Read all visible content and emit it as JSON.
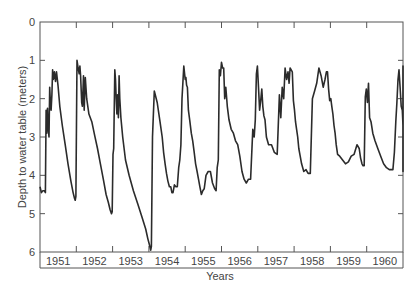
{
  "chart_data": {
    "type": "line",
    "title": "",
    "xlabel": "Years",
    "ylabel": "Depth to water table (meters)",
    "ylim": [
      0,
      6
    ],
    "y_inverted": true,
    "yticks": [
      0,
      1,
      2,
      3,
      4,
      5,
      6
    ],
    "xlim": [
      1950.0,
      1960.1
    ],
    "x_category_labels": [
      "1951",
      "1952",
      "1953",
      "1954",
      "1955",
      "1956",
      "1957",
      "1958",
      "1959",
      "1960"
    ],
    "grid": false,
    "legend": null,
    "line_color": "#2b2b2b",
    "note": "Values are approximate, estimated visually from the plotted curve (not transcribed from source data).",
    "series": [
      {
        "name": "Depth to water table",
        "x": [
          1950.0,
          1950.04,
          1950.08,
          1950.12,
          1950.15,
          1950.17,
          1950.19,
          1950.21,
          1950.23,
          1950.25,
          1950.27,
          1950.29,
          1950.31,
          1950.33,
          1950.35,
          1950.37,
          1950.4,
          1950.43,
          1950.46,
          1950.5,
          1950.55,
          1950.62,
          1950.7,
          1950.78,
          1950.86,
          1950.92,
          1950.96,
          1950.98,
          1951.0,
          1951.03,
          1951.06,
          1951.09,
          1951.11,
          1951.13,
          1951.16,
          1951.18,
          1951.21,
          1951.23,
          1951.26,
          1951.3,
          1951.36,
          1951.44,
          1951.52,
          1951.6,
          1951.68,
          1951.76,
          1951.84,
          1951.9,
          1951.95,
          1951.99,
          1952.01,
          1952.03,
          1952.05,
          1952.08,
          1952.1,
          1952.12,
          1952.14,
          1952.16,
          1952.18,
          1952.2,
          1952.22,
          1952.25,
          1952.3,
          1952.38,
          1952.48,
          1952.6,
          1952.72,
          1952.84,
          1952.94,
          1953.0,
          1953.04,
          1953.08,
          1953.1,
          1953.13,
          1953.18,
          1953.26,
          1953.34,
          1953.4,
          1953.44,
          1953.48,
          1953.52,
          1953.56,
          1953.6,
          1953.64,
          1953.67,
          1953.7,
          1953.74,
          1953.78,
          1953.82,
          1953.86,
          1953.89,
          1953.92,
          1953.95,
          1954.0,
          1954.04,
          1954.06,
          1954.08,
          1954.1,
          1954.13,
          1954.17,
          1954.21,
          1954.25,
          1954.29,
          1954.33,
          1954.37,
          1954.41,
          1954.45,
          1954.49,
          1954.53,
          1954.57,
          1954.62,
          1954.68,
          1954.74,
          1954.8,
          1954.86,
          1954.9,
          1954.93,
          1954.96,
          1954.99,
          1955.02,
          1955.05,
          1955.08,
          1955.11,
          1955.14,
          1955.17,
          1955.21,
          1955.26,
          1955.32,
          1955.38,
          1955.44,
          1955.5,
          1955.56,
          1955.62,
          1955.68,
          1955.74,
          1955.8,
          1955.86,
          1955.92,
          1955.96,
          1955.99,
          1956.02,
          1956.05,
          1956.08,
          1956.11,
          1956.14,
          1956.17,
          1956.2,
          1956.23,
          1956.26,
          1956.3,
          1956.36,
          1956.44,
          1956.52,
          1956.6,
          1956.66,
          1956.7,
          1956.74,
          1956.78,
          1956.82,
          1956.86,
          1956.9,
          1956.93,
          1956.96,
          1956.99,
          1957.02,
          1957.05,
          1957.08,
          1957.11,
          1957.14,
          1957.17,
          1957.2,
          1957.24,
          1957.28,
          1957.34,
          1957.4,
          1957.46,
          1957.52,
          1957.58,
          1957.64,
          1957.7,
          1957.76,
          1957.82,
          1957.88,
          1957.93,
          1957.97,
          1958.0,
          1958.03,
          1958.06,
          1958.09,
          1958.12,
          1958.15,
          1958.18,
          1958.21,
          1958.24,
          1958.28,
          1958.34,
          1958.42,
          1958.5,
          1958.58,
          1958.66,
          1958.74,
          1958.82,
          1958.88,
          1958.92,
          1958.96,
          1958.99,
          1959.02,
          1959.05,
          1959.08,
          1959.11,
          1959.14,
          1959.17,
          1959.21,
          1959.26,
          1959.32,
          1959.4,
          1959.48,
          1959.56,
          1959.64,
          1959.72,
          1959.78,
          1959.82,
          1959.86,
          1959.9,
          1959.93,
          1959.96,
          1959.99,
          1960.02,
          1960.05,
          1960.08,
          1960.11,
          1960.14,
          1960.17,
          1960.2,
          1960.24,
          1960.28,
          1960.32,
          1960.36,
          1960.4,
          1960.44,
          1960.48,
          1960.52,
          1960.56,
          1960.6,
          1960.64,
          1960.68,
          1960.72,
          1960.76,
          1960.8,
          1960.84,
          1960.88,
          1960.92,
          1960.96,
          1961.0,
          1961.04,
          1961.08
        ],
        "y": [
          4.3,
          4.45,
          4.4,
          4.4,
          4.45,
          2.3,
          2.9,
          2.25,
          2.8,
          3.0,
          1.7,
          2.1,
          2.3,
          1.9,
          1.25,
          1.5,
          1.3,
          1.55,
          1.3,
          1.65,
          2.2,
          2.7,
          3.2,
          3.7,
          4.15,
          4.45,
          4.6,
          4.65,
          4.55,
          1.0,
          1.2,
          1.35,
          1.15,
          1.4,
          2.1,
          2.2,
          1.4,
          2.3,
          1.45,
          2.0,
          2.4,
          2.6,
          2.95,
          3.3,
          3.7,
          4.1,
          4.5,
          4.7,
          4.9,
          5.0,
          4.95,
          3.45,
          3.3,
          1.25,
          1.5,
          2.0,
          2.4,
          1.9,
          2.5,
          1.4,
          2.0,
          2.5,
          3.0,
          3.6,
          4.0,
          4.4,
          4.75,
          5.1,
          5.4,
          5.65,
          5.8,
          5.95,
          5.85,
          3.0,
          1.8,
          2.1,
          2.6,
          3.0,
          3.4,
          3.7,
          3.95,
          4.15,
          4.3,
          4.3,
          4.45,
          4.45,
          4.25,
          4.3,
          4.3,
          3.8,
          3.6,
          3.2,
          2.0,
          1.15,
          1.5,
          1.45,
          1.65,
          1.7,
          2.3,
          2.6,
          2.9,
          3.1,
          3.4,
          3.7,
          3.9,
          4.1,
          4.3,
          4.5,
          4.4,
          4.35,
          4.0,
          3.9,
          3.9,
          4.2,
          4.35,
          4.4,
          3.8,
          3.6,
          1.25,
          1.4,
          1.05,
          1.2,
          1.2,
          2.0,
          1.7,
          2.2,
          2.55,
          2.8,
          2.9,
          3.1,
          3.2,
          3.5,
          3.9,
          4.1,
          4.2,
          4.1,
          4.1,
          2.8,
          3.0,
          2.55,
          1.35,
          1.15,
          1.7,
          2.3,
          2.05,
          1.75,
          2.2,
          2.45,
          2.55,
          3.0,
          3.2,
          3.2,
          3.4,
          3.45,
          1.9,
          2.5,
          1.7,
          2.0,
          1.2,
          1.5,
          1.3,
          1.6,
          1.2,
          1.25,
          1.3,
          2.05,
          2.3,
          2.6,
          2.8,
          3.0,
          3.3,
          3.5,
          3.7,
          3.9,
          3.85,
          3.95,
          3.95,
          2.0,
          1.8,
          1.6,
          1.2,
          1.4,
          1.7,
          1.5,
          1.3,
          1.3,
          1.75,
          2.05,
          2.0,
          2.2,
          2.4,
          2.7,
          2.9,
          3.2,
          3.45,
          3.5,
          3.6,
          3.7,
          3.65,
          3.5,
          3.45,
          3.2,
          3.3,
          3.55,
          3.7,
          3.75,
          3.75,
          1.95,
          1.75,
          2.1,
          1.6,
          2.5,
          2.6,
          2.9,
          3.1,
          3.3,
          3.5,
          3.7,
          3.8,
          3.85,
          3.85,
          3.85,
          3.4,
          2.6,
          2.1,
          1.5,
          1.25,
          1.7,
          2.2,
          2.3,
          2.7,
          2.9,
          3.05,
          3.1,
          3.15,
          3.2,
          3.5,
          3.6,
          3.75,
          3.85,
          3.9,
          3.9,
          3.9,
          3.85,
          3.3,
          2.85,
          2.35,
          1.85,
          1.15,
          2.4,
          2.05,
          2.5,
          2.4,
          2.6,
          2.9,
          3.2
        ]
      }
    ]
  }
}
